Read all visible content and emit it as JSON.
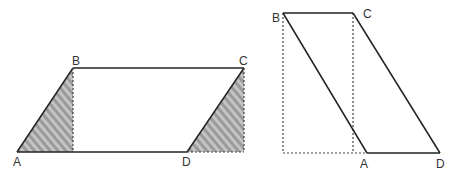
{
  "figures": [
    {
      "name": "parallelogram-to-rectangle",
      "labels": {
        "A": "A",
        "B": "B",
        "C": "C",
        "D": "D"
      },
      "points": {
        "A": [
          17,
          152
        ],
        "B": [
          73,
          68
        ],
        "C": [
          244,
          68
        ],
        "D": [
          187,
          152
        ]
      },
      "feet": {
        "B_foot": [
          73,
          152
        ],
        "C_foot": [
          244,
          152
        ]
      },
      "shaded_triangles": [
        "A-B-B_foot",
        "D-C-C_foot"
      ]
    },
    {
      "name": "slanted-parallelogram",
      "labels": {
        "A": "A",
        "B": "B",
        "C": "C",
        "D": "D"
      },
      "points": {
        "A": [
          367,
          153
        ],
        "B": [
          283,
          13
        ],
        "C": [
          353,
          13
        ],
        "D": [
          440,
          153
        ]
      },
      "feet": {
        "B_foot": [
          283,
          153
        ],
        "C_foot": [
          353,
          153
        ]
      }
    }
  ],
  "colors": {
    "line": "#222222",
    "dashed": "#444444",
    "hatch_fill": "#bdbdbd",
    "hatch_stripe": "#8f8f8f"
  }
}
